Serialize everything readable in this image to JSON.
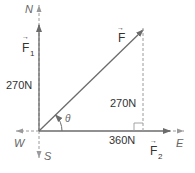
{
  "diagram": {
    "type": "force-vector-diagram",
    "compass": {
      "north": "N",
      "south": "S",
      "east": "E",
      "west": "W"
    },
    "vectors": {
      "resultant": {
        "symbol": "F",
        "label": "F⃗"
      },
      "f1": {
        "symbol": "F",
        "subscript": "1",
        "magnitude_label": "270N"
      },
      "f2": {
        "symbol": "F",
        "subscript": "2",
        "magnitude_label": "360N"
      }
    },
    "vertical_component_label": "270N",
    "angle_label": "θ",
    "colors": {
      "vector_line": "#6b6b6b",
      "axis_dashed": "#9a9a9a",
      "text": "#333333",
      "compass_text": "#666666"
    }
  }
}
